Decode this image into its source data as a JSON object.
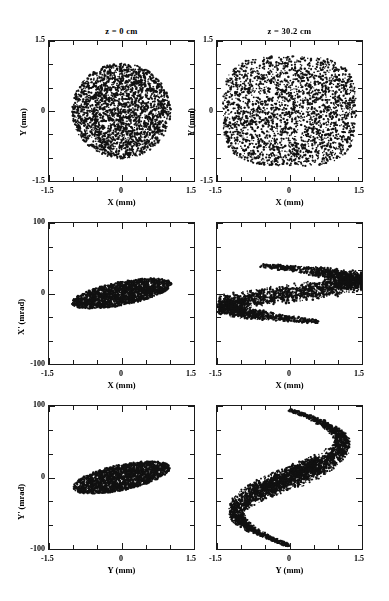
{
  "figure": {
    "caption_titles": [
      "z = 0 cm",
      "z = 30.2 cm"
    ],
    "background": "#ffffff",
    "marker_color": "#111111"
  },
  "chart_data": [
    {
      "id": "panel-xy-z0",
      "type": "scatter",
      "title": "z = 0 cm",
      "xlabel": "X (mm)",
      "ylabel": "Y (mm)",
      "xlim": [
        -1.5,
        1.5
      ],
      "ylim": [
        -1.5,
        1.5
      ],
      "xticks": [
        -1.5,
        0,
        1.5
      ],
      "xtick_labels": [
        "-1.5",
        "0",
        "1.5"
      ],
      "yticks": [
        -1.5,
        0,
        1.5
      ],
      "ytick_labels": [
        "-1.5",
        "0",
        "1.5"
      ],
      "grid": false,
      "n_points": 2600,
      "shape": "uniform-disk",
      "shape_params": {
        "cx": 0.0,
        "cy": 0.0,
        "radius": 1.02
      },
      "annotation": "Initial transverse beam cross-section: uniform round spot of radius ~1.0 mm"
    },
    {
      "id": "panel-xy-z302",
      "type": "scatter",
      "title": "z = 30.2 cm",
      "xlabel": "X (mm)",
      "ylabel": "Y (mm)",
      "xlim": [
        -1.5,
        1.5
      ],
      "ylim": [
        -1.5,
        1.5
      ],
      "xticks": [
        -1.5,
        0,
        1.5
      ],
      "xtick_labels": [
        "-1.5",
        "0",
        "1.5"
      ],
      "yticks": [
        -1.5,
        0,
        1.5
      ],
      "ytick_labels": [
        "-1.5",
        "0",
        "1.5"
      ],
      "grid": false,
      "n_points": 2600,
      "shape": "uniform-superellipse",
      "shape_params": {
        "cx": 0.0,
        "cy": 0.0,
        "a": 1.38,
        "b": 1.18,
        "exponent": 3.2
      },
      "annotation": "Beam cross-section has expanded and squared off into a rounded rectangle"
    },
    {
      "id": "panel-xxp-z0",
      "type": "scatter",
      "title": "",
      "xlabel": "X (mm)",
      "ylabel": "X' (mrad)",
      "xlim": [
        -1.5,
        1.5
      ],
      "ylim": [
        -100,
        100
      ],
      "xticks": [
        -1.5,
        0,
        1.5
      ],
      "xtick_labels": [
        "-1.5",
        "0",
        "1.5"
      ],
      "yticks": [
        -100,
        0,
        100
      ],
      "ytick_labels": [
        "-100",
        "0",
        "100"
      ],
      "grid": false,
      "n_points": 2300,
      "shape": "tilted-filled-ellipse",
      "shape_params": {
        "cx": 0.0,
        "cy": 0.0,
        "semi_major": 1.1,
        "semi_minor": 0.42,
        "tilt_deg": 22,
        "y_scale_mrad_per_mm": 38
      },
      "annotation": "Upright-to-diverging horizontal phase space ellipse, positive correlation"
    },
    {
      "id": "panel-xxp-z302",
      "type": "scatter",
      "title": "",
      "xlabel": "X (mm)",
      "ylabel": "X' (mrad)",
      "xlim": [
        -1.5,
        1.5
      ],
      "ylim": [
        -100,
        100
      ],
      "xticks": [
        -1.5,
        0,
        1.5
      ],
      "xtick_labels": [
        "-1.5",
        "0",
        "1.5"
      ],
      "yticks": [
        -100,
        0,
        100
      ],
      "ytick_labels": [
        "-100",
        "0",
        "100"
      ],
      "grid": false,
      "n_points": 2600,
      "shape": "s-filament",
      "shape_params": {
        "amplitude_mrad": 40,
        "x_extent": [
          -1.35,
          1.45
        ],
        "thickness_mrad": 18
      },
      "annotation": "Nonlinear aberration folds the horizontal phase space into an S-shape"
    },
    {
      "id": "panel-yyp-z0",
      "type": "scatter",
      "title": "",
      "xlabel": "Y (mm)",
      "ylabel": "Y' (mrad)",
      "xlim": [
        -1.5,
        1.5
      ],
      "ylim": [
        -100,
        100
      ],
      "xticks": [
        -1.5,
        0,
        1.5
      ],
      "xtick_labels": [
        "-1.5",
        "0",
        "1.5"
      ],
      "yticks": [
        -100,
        0,
        100
      ],
      "ytick_labels": [
        "-100",
        "0",
        "100"
      ],
      "grid": false,
      "n_points": 2300,
      "shape": "tilted-filled-ellipse",
      "shape_params": {
        "cx": 0.0,
        "cy": 0.0,
        "semi_major": 1.08,
        "semi_minor": 0.45,
        "tilt_deg": 24,
        "y_scale_mrad_per_mm": 38
      },
      "annotation": "Vertical phase space ellipse, similar tilt to the horizontal plane"
    },
    {
      "id": "panel-yyp-z302",
      "type": "scatter",
      "title": "",
      "xlabel": "Y (mm)",
      "ylabel": "Y' (mrad)",
      "xlim": [
        -1.5,
        1.5
      ],
      "ylim": [
        -100,
        100
      ],
      "xticks": [
        -1.5,
        0,
        1.5
      ],
      "xtick_labels": [
        "-1.5",
        "0",
        "1.5"
      ],
      "yticks": [
        -100,
        0,
        100
      ],
      "ytick_labels": [
        "-100",
        "0",
        "100"
      ],
      "grid": false,
      "n_points": 2600,
      "shape": "arrow-filament",
      "shape_params": {
        "amplitude_mrad": 95,
        "y_extent": [
          -1.35,
          1.25
        ],
        "thickness_mrad": 20
      },
      "annotation": "Strongly folded vertical phase space with long tails reaching +/-95 mrad"
    }
  ],
  "panels": {
    "r1c1": {
      "title": "z = 0 cm",
      "xlabel": "X (mm)",
      "ylabel": "Y (mm)",
      "xt0": "-1.5",
      "xt1": "0",
      "xt2": "1.5",
      "yt0": "1.5",
      "yt1": "0",
      "yt2": "-1.5"
    },
    "r1c2": {
      "title": "z = 30.2 cm",
      "xlabel": "X (mm)",
      "ylabel": "Y (mm)",
      "xt0": "-1.5",
      "xt1": "0",
      "xt2": "1.5",
      "yt0": "1.5",
      "yt1": "0",
      "yt2": "-1.5"
    },
    "r2c1": {
      "title": "",
      "xlabel": "X (mm)",
      "ylabel": "X' (mrad)",
      "xt0": "-1.5",
      "xt1": "0",
      "xt2": "1.5",
      "yt0": "100",
      "yt1": "0",
      "yt2": "-100"
    },
    "r2c2": {
      "title": "",
      "xlabel": "X (mm)",
      "ylabel": "X' (mrad)",
      "xt0": "-1.5",
      "xt1": "0",
      "xt2": "1.5",
      "yt0": "100",
      "yt1": "0",
      "yt2": "-100"
    },
    "r3c1": {
      "title": "",
      "xlabel": "Y (mm)",
      "ylabel": "Y' (mrad)",
      "xt0": "-1.5",
      "xt1": "0",
      "xt2": "1.5",
      "yt0": "100",
      "yt1": "0",
      "yt2": "-100"
    },
    "r3c2": {
      "title": "",
      "xlabel": "Y (mm)",
      "ylabel": "Y' (mrad)",
      "xt0": "-1.5",
      "xt1": "0",
      "xt2": "1.5",
      "yt0": "100",
      "yt1": "0",
      "yt2": "-100"
    }
  }
}
